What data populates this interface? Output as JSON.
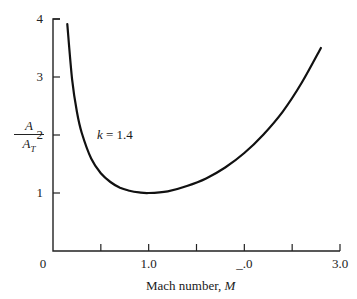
{
  "chart_data": {
    "type": "line",
    "title": "",
    "xlabel": "Mach number, M",
    "ylabel": "A / A_T",
    "xlim": [
      0,
      3.0
    ],
    "ylim": [
      0,
      4
    ],
    "grid": false,
    "legend": null,
    "x_ticks": [
      0,
      0.5,
      1.0,
      1.5,
      2.0,
      2.5,
      3.0
    ],
    "x_tick_labels": [
      "0",
      "",
      "1.0",
      "",
      "_.0",
      "",
      "3.0"
    ],
    "y_ticks": [
      1,
      2,
      3,
      4
    ],
    "y_tick_labels": [
      "1",
      "2",
      "3",
      "4"
    ],
    "annotations": [
      {
        "text": "k = 1.4",
        "x": 0.45,
        "y": 2.0
      }
    ],
    "series": [
      {
        "name": "k = 1.4",
        "x": [
          0.15,
          0.2,
          0.25,
          0.3,
          0.4,
          0.5,
          0.6,
          0.7,
          0.8,
          0.9,
          1.0,
          1.2,
          1.4,
          1.6,
          1.8,
          2.0,
          2.2,
          2.4,
          2.6,
          2.8
        ],
        "values": [
          3.91,
          2.96,
          2.4,
          2.04,
          1.59,
          1.34,
          1.19,
          1.09,
          1.04,
          1.01,
          1.0,
          1.03,
          1.12,
          1.25,
          1.44,
          1.69,
          2.01,
          2.4,
          2.9,
          3.5
        ]
      }
    ]
  },
  "labels": {
    "y_num": "A",
    "y_den": "A",
    "y_den_sub": "T",
    "x_text": "Mach number, ",
    "x_var": "M",
    "annot_var": "k",
    "annot_rest": " = 1.4"
  }
}
